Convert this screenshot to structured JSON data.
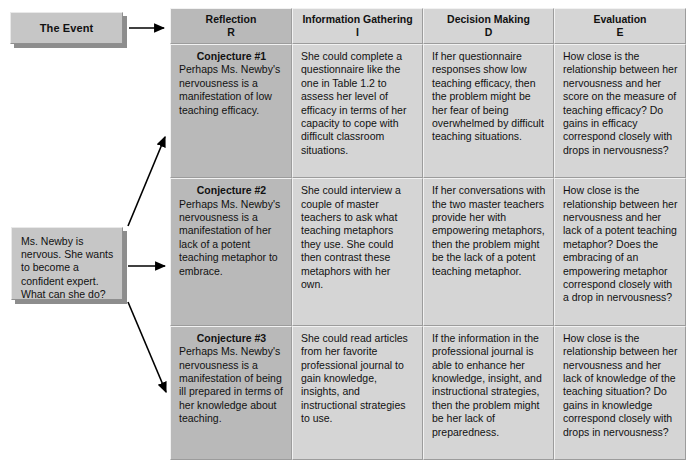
{
  "event": {
    "label": "The Event"
  },
  "scenario": {
    "text": "Ms. Newby is nervous. She wants to become a confident expert. What can she do?"
  },
  "matrix": {
    "headers": [
      {
        "title": "Reflection",
        "code": "R"
      },
      {
        "title": "Information Gathering",
        "code": "I"
      },
      {
        "title": "Decision Making",
        "code": "D"
      },
      {
        "title": "Evaluation",
        "code": "E"
      }
    ],
    "rows": [
      {
        "conjecture_title": "Conjecture #1",
        "reflection": "Perhaps Ms. Newby's nervousness is a manifestation of low teaching efficacy.",
        "information_gathering": "She could complete a questionnaire like the one in Table 1.2 to assess her level of efficacy in terms of her capacity to cope with difficult classroom situations.",
        "decision_making": "If her questionnaire responses show low teaching efficacy, then the problem might be her fear of being overwhelmed by difficult teaching situations.",
        "evaluation": "How close is the relationship between her nervousness and her score on the measure of teaching efficacy? Do gains in efficacy correspond closely with drops in nervousness?"
      },
      {
        "conjecture_title": "Conjecture #2",
        "reflection": "Perhaps Ms. Newby's nervousness is a manifestation of her lack of a potent teaching metaphor to embrace.",
        "information_gathering": "She could interview a couple of master teachers to ask what teaching metaphors they use. She could then contrast these metaphors with her own.",
        "decision_making": "If her conversations with the two master teachers provide her with empowering metaphors, then the problem might be the lack of a potent teaching metaphor.",
        "evaluation": "How close is the relationship between her nervousness and her lack of a potent teaching metaphor? Does the embracing of an empowering metaphor correspond closely with a drop in nervousness?"
      },
      {
        "conjecture_title": "Conjecture #3",
        "reflection": "Perhaps Ms. Newby's nervousness is a manifestation of being ill prepared in terms of her knowledge about teaching.",
        "information_gathering": "She could read articles from her favorite professional journal to gain knowledge, insights, and instructional strategies to use.",
        "decision_making": "If the information in the professional journal is able to enhance her knowledge, insight, and instructional strategies, then the problem might be her lack of preparedness.",
        "evaluation": "How close is the relationship between her nervousness and her lack of knowledge of the teaching situation? Do gains in knowledge correspond closely with drops in nervousness?"
      }
    ]
  },
  "colors": {
    "reflection_fill": "#b9b9b9",
    "other_fill": "#d5d5d5",
    "box_fill": "#c6c6c6",
    "shadow": "#8d8d8d",
    "arrow": "#000000"
  }
}
